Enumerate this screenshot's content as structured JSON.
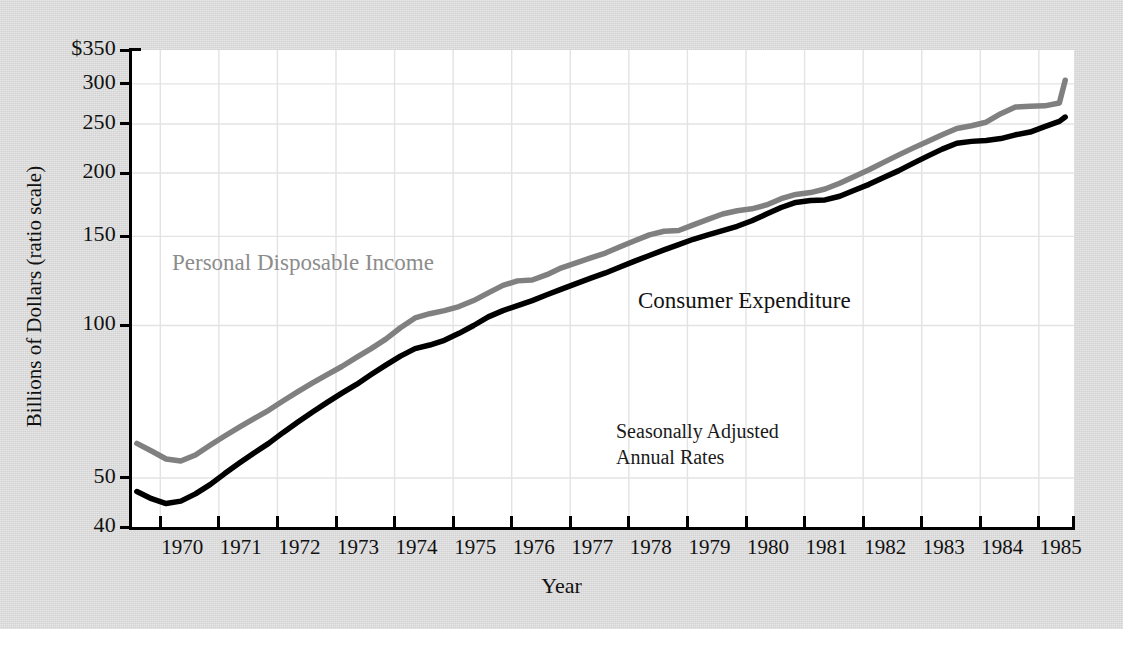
{
  "chart_data": {
    "type": "line",
    "title": "",
    "xlabel": "Year",
    "ylabel": "Billions of Dollars (ratio scale)",
    "scale": "log",
    "grid": true,
    "legend_position": "inline-annotation",
    "xlim": [
      1969.5,
      1985.6
    ],
    "ylim": [
      40,
      350
    ],
    "xticks": [
      "1970",
      "1971",
      "1972",
      "1973",
      "1974",
      "1975",
      "1976",
      "1977",
      "1978",
      "1979",
      "1980",
      "1981",
      "1982",
      "1983",
      "1984",
      "1985"
    ],
    "yticks": [
      "$350",
      "300",
      "250",
      "200",
      "150",
      "100",
      "50",
      "40"
    ],
    "ytick_values": [
      350,
      300,
      250,
      200,
      150,
      100,
      50,
      40
    ],
    "annotations": [
      {
        "name": "seasonally-adjusted-note",
        "line1": "Seasonally Adjusted",
        "line2": "Annual Rates"
      }
    ],
    "series": [
      {
        "name": "Personal Disposable Income",
        "color": "#808080",
        "x": [
          1969.6,
          1969.85,
          1970.1,
          1970.35,
          1970.6,
          1970.85,
          1971.1,
          1971.35,
          1971.6,
          1971.85,
          1972.1,
          1972.35,
          1972.6,
          1972.85,
          1973.1,
          1973.35,
          1973.6,
          1973.85,
          1974.1,
          1974.35,
          1974.6,
          1974.85,
          1975.1,
          1975.35,
          1975.6,
          1975.85,
          1976.1,
          1976.35,
          1976.6,
          1976.85,
          1977.1,
          1977.35,
          1977.6,
          1977.85,
          1978.1,
          1978.35,
          1978.6,
          1978.85,
          1979.1,
          1979.35,
          1979.6,
          1979.85,
          1980.1,
          1980.35,
          1980.6,
          1980.85,
          1981.1,
          1981.35,
          1981.6,
          1981.85,
          1982.1,
          1982.35,
          1982.6,
          1982.85,
          1983.1,
          1983.35,
          1983.6,
          1983.85,
          1984.1,
          1984.35,
          1984.6,
          1984.85,
          1985.1,
          1985.35
        ],
        "y": [
          58.5,
          56.5,
          54.5,
          54.0,
          55.5,
          58.0,
          60.5,
          63.0,
          65.5,
          68.0,
          71.0,
          74.0,
          77.0,
          80.0,
          83.0,
          86.5,
          90.0,
          94.0,
          99.0,
          103.5,
          105.5,
          107.0,
          109.0,
          112.0,
          116.0,
          120.0,
          122.5,
          123.0,
          126.0,
          130.0,
          133.0,
          136.0,
          139.0,
          143.0,
          147.0,
          151.0,
          153.5,
          154.0,
          158.0,
          162.0,
          166.0,
          168.5,
          170.0,
          173.0,
          178.0,
          181.5,
          183.0,
          186.0,
          191.0,
          197.0,
          203.0,
          210.0,
          217.0,
          224.0,
          231.0,
          238.0,
          245.0,
          248.0,
          252.0,
          262.0,
          270.0,
          271.0,
          271.5,
          275.0
        ],
        "y_end": [
          1985.45,
          305.0
        ]
      },
      {
        "name": "Consumer Expenditure",
        "color": "#000000",
        "x": [
          1969.6,
          1969.85,
          1970.1,
          1970.35,
          1970.6,
          1970.85,
          1971.1,
          1971.35,
          1971.6,
          1971.85,
          1972.1,
          1972.35,
          1972.6,
          1972.85,
          1973.1,
          1973.35,
          1973.6,
          1973.85,
          1974.1,
          1974.35,
          1974.6,
          1974.85,
          1975.1,
          1975.35,
          1975.6,
          1975.85,
          1976.1,
          1976.35,
          1976.6,
          1976.85,
          1977.1,
          1977.35,
          1977.6,
          1977.85,
          1978.1,
          1978.35,
          1978.6,
          1978.85,
          1979.1,
          1979.35,
          1979.6,
          1979.85,
          1980.1,
          1980.35,
          1980.6,
          1980.85,
          1981.1,
          1981.35,
          1981.6,
          1981.85,
          1982.1,
          1982.35,
          1982.6,
          1982.85,
          1983.1,
          1983.35,
          1983.6,
          1983.85,
          1984.1,
          1984.35,
          1984.6,
          1984.85,
          1985.1,
          1985.35
        ],
        "y": [
          47.0,
          45.5,
          44.5,
          45.0,
          46.5,
          48.5,
          51.0,
          53.5,
          56.0,
          58.5,
          61.5,
          64.5,
          67.5,
          70.5,
          73.5,
          76.5,
          80.0,
          83.5,
          87.0,
          90.0,
          91.5,
          93.5,
          96.5,
          100.0,
          104.0,
          107.0,
          109.5,
          112.0,
          115.0,
          118.0,
          121.0,
          124.0,
          127.0,
          130.5,
          134.0,
          137.5,
          141.0,
          144.5,
          148.0,
          151.0,
          154.0,
          157.0,
          161.0,
          166.0,
          171.0,
          175.0,
          176.5,
          177.0,
          180.0,
          185.0,
          190.0,
          196.0,
          202.0,
          209.0,
          216.0,
          223.0,
          229.0,
          231.0,
          232.0,
          234.0,
          238.0,
          241.0,
          247.0,
          253.0
        ],
        "y_end": [
          1985.45,
          258.0
        ]
      }
    ]
  },
  "axes": {
    "ylabel": "Billions of Dollars (ratio scale)",
    "xlabel": "Year",
    "yticks": [
      "$350",
      "300",
      "250",
      "200",
      "150",
      "100",
      "50",
      "40"
    ],
    "xticks": [
      "1970",
      "1971",
      "1972",
      "1973",
      "1974",
      "1975",
      "1976",
      "1977",
      "1978",
      "1979",
      "1980",
      "1981",
      "1982",
      "1983",
      "1984",
      "1985"
    ]
  },
  "labels": {
    "personal_disposable_income": "Personal Disposable Income",
    "consumer_expenditure": "Consumer Expenditure",
    "annotation_line1": "Seasonally Adjusted",
    "annotation_line2": "Annual Rates"
  },
  "colors": {
    "income_line": "#808080",
    "expenditure_line": "#000000",
    "grid": "#e3e3e3",
    "panel_background": "#d8d8d8",
    "plot_background": "#ffffff",
    "axis": "#000000"
  }
}
